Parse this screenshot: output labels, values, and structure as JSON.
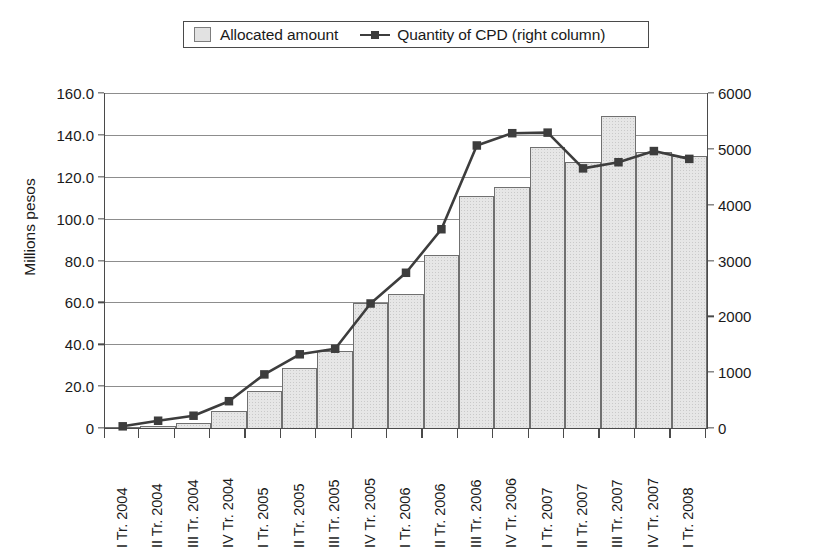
{
  "legend": {
    "position": "top-center",
    "entries": [
      {
        "label": "Allocated amount",
        "marker": "bar-swatch-icon",
        "color": "#e6e6e6"
      },
      {
        "label": "Quantity of CPD (right column)",
        "marker": "line-square-marker-icon",
        "color": "#3d3d3d"
      }
    ]
  },
  "axes": {
    "left_title": "Millions pesos",
    "left_ticks": [
      "0",
      "20.0",
      "40.0",
      "60.0",
      "80.0",
      "100.0",
      "120.0",
      "140.0",
      "160.0"
    ],
    "right_ticks": [
      "0",
      "1000",
      "2000",
      "3000",
      "4000",
      "5000",
      "6000"
    ]
  },
  "chart_data": {
    "type": "bar",
    "title": "",
    "subtitle": "",
    "xlabel": "",
    "ylabel": "Millions pesos",
    "y2label": "",
    "grid": true,
    "legend_position": "top-center",
    "ylim": [
      0,
      160
    ],
    "y2lim": [
      0,
      6000
    ],
    "ytick_step": 20,
    "y2tick_step": 1000,
    "categories": [
      "I Tr. 2004",
      "II Tr. 2004",
      "III Tr. 2004",
      "IV Tr. 2004",
      "I Tr. 2005",
      "II Tr. 2005",
      "III Tr. 2005",
      "IV Tr. 2005",
      "I Tr. 2006",
      "II Tr. 2006",
      "III Tr. 2006",
      "IV Tr. 2006",
      "I Tr. 2007",
      "II Tr. 2007",
      "III Tr. 2007",
      "IV Tr. 2007",
      "I Tr. 2008"
    ],
    "series": [
      {
        "name": "Allocated amount",
        "type": "bar",
        "axis": "left",
        "units": "Millions pesos",
        "color": "#e6e6e6",
        "edge_color": "#707070",
        "values": [
          0.3,
          1.0,
          2.5,
          8.0,
          17.5,
          28.5,
          37.0,
          59.5,
          64.0,
          82.5,
          111.0,
          115.0,
          134.0,
          127.0,
          149.0,
          132.0,
          130.0
        ]
      },
      {
        "name": "Quantity of CPD (right column)",
        "type": "line",
        "axis": "right",
        "units": "units",
        "color": "#3d3d3d",
        "marker": "square",
        "values": [
          30,
          130,
          220,
          480,
          960,
          1320,
          1420,
          2230,
          2780,
          3560,
          5060,
          5280,
          5290,
          4650,
          4760,
          4960,
          4820
        ]
      }
    ]
  }
}
